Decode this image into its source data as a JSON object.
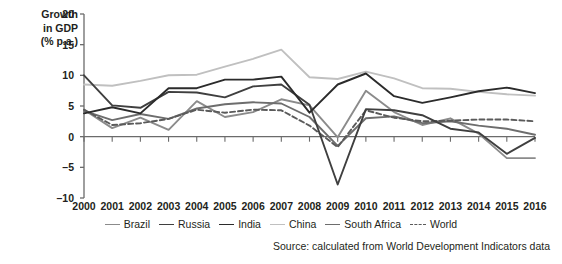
{
  "chart_data": {
    "type": "line",
    "title": "",
    "ylabel_lines": [
      "Growth",
      "in GDP",
      "(% p.a.)"
    ],
    "xlabel": "",
    "ylim": [
      -10,
      20
    ],
    "yticks": [
      20,
      15,
      10,
      5,
      0,
      -5,
      -10
    ],
    "ytick_labels": [
      "20",
      "15",
      "10",
      "5",
      "0",
      "–5",
      "–10"
    ],
    "grid": false,
    "legend_position": "bottom",
    "categories": [
      "2000",
      "2001",
      "2002",
      "2003",
      "2004",
      "2005",
      "2006",
      "2007",
      "2008",
      "2009",
      "2010",
      "2011",
      "2012",
      "2013",
      "2014",
      "2015",
      "2016"
    ],
    "series": [
      {
        "name": "Brazil",
        "color": "#8b8b8b",
        "style": "solid",
        "values": [
          4.4,
          1.4,
          3.1,
          1.1,
          5.8,
          3.2,
          4.0,
          6.1,
          5.1,
          -0.1,
          7.5,
          4.0,
          1.9,
          3.0,
          0.5,
          -3.5,
          -3.5
        ]
      },
      {
        "name": "Russia",
        "color": "#3f3f3f",
        "style": "solid",
        "values": [
          10.0,
          5.1,
          4.7,
          7.3,
          7.2,
          6.4,
          8.2,
          8.5,
          5.2,
          -7.8,
          4.5,
          4.3,
          3.5,
          1.3,
          0.7,
          -2.8,
          -0.2
        ]
      },
      {
        "name": "India",
        "color": "#2b2b2b",
        "style": "solid",
        "values": [
          3.8,
          4.8,
          3.8,
          7.9,
          7.9,
          9.3,
          9.3,
          9.8,
          3.9,
          8.5,
          10.3,
          6.6,
          5.5,
          6.4,
          7.4,
          8.0,
          7.1
        ]
      },
      {
        "name": "China",
        "color": "#c0c0c0",
        "style": "solid",
        "values": [
          8.5,
          8.3,
          9.1,
          10.0,
          10.1,
          11.4,
          12.7,
          14.2,
          9.7,
          9.4,
          10.6,
          9.5,
          7.9,
          7.8,
          7.3,
          6.9,
          6.7
        ]
      },
      {
        "name": "South Africa",
        "color": "#6d6d6d",
        "style": "solid",
        "values": [
          4.2,
          2.7,
          3.7,
          2.9,
          4.6,
          5.3,
          5.6,
          5.4,
          3.2,
          -1.5,
          3.0,
          3.3,
          2.2,
          2.5,
          1.8,
          1.3,
          0.3
        ]
      },
      {
        "name": "World",
        "color": "#5a5a5a",
        "style": "dashed",
        "values": [
          4.4,
          1.9,
          2.2,
          2.9,
          4.4,
          3.9,
          4.4,
          4.3,
          1.8,
          -1.7,
          4.3,
          3.1,
          2.5,
          2.6,
          2.8,
          2.8,
          2.5
        ]
      }
    ],
    "source_note": "Source: calculated from World Development Indicators data"
  },
  "axis": {
    "y_title_1": "Growth",
    "y_title_2": "in GDP",
    "y_title_3": "(% p.a.)"
  }
}
